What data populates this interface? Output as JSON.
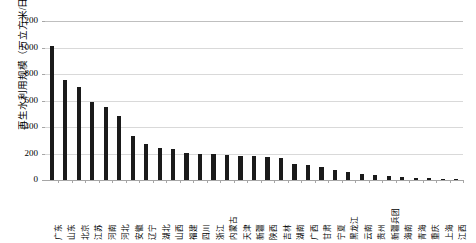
{
  "chart_data": {
    "type": "bar",
    "title": "",
    "subtitle": "",
    "xlabel": "",
    "ylabel": "再生水利用规模（万立方米/日）",
    "ylim": [
      0,
      1200
    ],
    "yticks": [
      0,
      200,
      400,
      600,
      800,
      1000,
      1200
    ],
    "ytick_labels": [
      "0",
      "200",
      "400",
      "600",
      "800",
      "1000",
      "1200"
    ],
    "grid": true,
    "legend": "none",
    "bar_color": "#1a1a1a",
    "gridline_color": "#d9d9d9",
    "categories": [
      "广东",
      "山东",
      "北京",
      "江苏",
      "河南",
      "河北",
      "安徽",
      "辽宁",
      "湖北",
      "山西",
      "福建",
      "四川",
      "浙江",
      "内蒙古",
      "天津",
      "新疆",
      "陕西",
      "吉林",
      "湖南",
      "广西",
      "甘肃",
      "宁夏",
      "黑龙江",
      "云南",
      "贵州",
      "新疆兵团",
      "海南",
      "青海",
      "重庆",
      "上海",
      "江西"
    ],
    "values": [
      1010,
      755,
      705,
      590,
      550,
      485,
      330,
      270,
      240,
      235,
      205,
      200,
      195,
      190,
      185,
      180,
      175,
      168,
      120,
      110,
      95,
      72,
      58,
      45,
      38,
      30,
      24,
      18,
      12,
      8,
      5
    ],
    "series": [
      {
        "name": "再生水利用规模",
        "values": [
          1010,
          755,
          705,
          590,
          550,
          485,
          330,
          270,
          240,
          235,
          205,
          200,
          195,
          190,
          185,
          180,
          175,
          168,
          120,
          110,
          95,
          72,
          58,
          45,
          38,
          30,
          24,
          18,
          12,
          8,
          5
        ]
      }
    ]
  }
}
